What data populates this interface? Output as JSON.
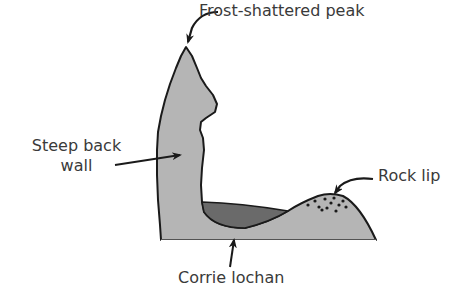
{
  "diagram": {
    "labels": {
      "peak": "Frost-shattered peak",
      "back_wall_line1": "Steep back",
      "back_wall_line2": "wall",
      "rock_lip": "Rock lip",
      "corrie_lochan": "Corrie lochan"
    },
    "colors": {
      "rock_fill": "#b5b5b5",
      "water_fill": "#6a6a6a",
      "outline": "#1a1a1a",
      "text": "#3a3a3a",
      "background": "#ffffff"
    }
  }
}
